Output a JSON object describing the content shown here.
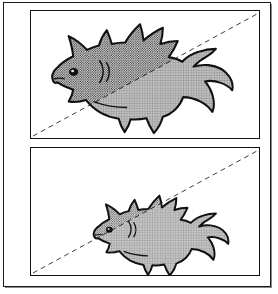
{
  "figure": {
    "caption": "",
    "panel_count": 2,
    "background_color": "#ffffff",
    "ink_color": "#111111",
    "frame_color": "#1a1a1a"
  },
  "textures": {
    "upper_region": {
      "name": "dense-dot-halftone",
      "description": "dark coarse dotted halftone fill above the dashed line",
      "dot_color": "#1d1d1d",
      "fill_color": "#dcdcdc",
      "spacing_px": 2.4
    },
    "lower_region": {
      "name": "light-crosshatch-halftone",
      "description": "lighter cross-hatch fill below the dashed line",
      "line_color": "#6d6d6d",
      "fill_color": "#b9b9b9",
      "spacing_px": 2.6
    }
  },
  "panels": [
    {
      "id": "panel-top",
      "label": "upper panel",
      "divider": {
        "name": "dashed-diagonal-line",
        "style": "dashed",
        "color": "#3a3a3a",
        "width_px": 1,
        "dash_pattern": "5 4",
        "start": [
          2,
          127
        ],
        "end": [
          228,
          3
        ]
      },
      "subject": {
        "name": "fish",
        "orientation": "facing-left",
        "size": "large",
        "features": [
          "dorsal-fin",
          "pectoral-fin",
          "ventral-fin",
          "forked-tail",
          "eye",
          "gill-lines"
        ]
      }
    },
    {
      "id": "panel-bottom",
      "label": "lower panel",
      "divider": {
        "name": "dashed-diagonal-line",
        "style": "dashed",
        "color": "#3a3a3a",
        "width_px": 1,
        "dash_pattern": "5 4",
        "start": [
          2,
          127
        ],
        "end": [
          228,
          3
        ]
      },
      "subject": {
        "name": "fish",
        "orientation": "facing-left",
        "size": "small",
        "features": [
          "dorsal-fin",
          "pectoral-fin",
          "ventral-fin",
          "forked-tail",
          "eye",
          "gill-lines"
        ]
      }
    }
  ]
}
